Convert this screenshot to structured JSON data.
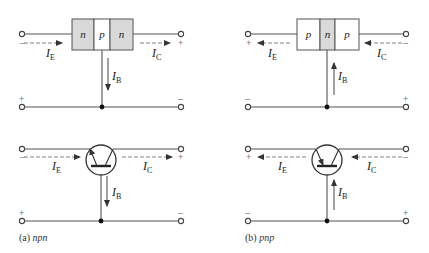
{
  "colors": {
    "line": "#555555",
    "shaded_region": "#d9d9d9",
    "unshaded_region": "#ffffff",
    "text": "#222222"
  },
  "npn": {
    "caption_prefix": "(a)",
    "caption_type": "npn",
    "layers": [
      "n",
      "p",
      "n"
    ],
    "shaded": [
      true,
      false,
      true
    ],
    "emitter_current": {
      "symbol": "I",
      "sub": "E",
      "direction": "right"
    },
    "collector_current": {
      "symbol": "I",
      "sub": "C",
      "direction": "right"
    },
    "base_current": {
      "symbol": "I",
      "sub": "B",
      "direction": "down"
    },
    "signs_top": {
      "left": "–",
      "right": "+"
    },
    "signs_bottom": {
      "left": "+",
      "right": "–"
    },
    "symbol": {
      "emitter_arrow": "outward"
    }
  },
  "pnp": {
    "caption_prefix": "(b)",
    "caption_type": "pnp",
    "layers": [
      "p",
      "n",
      "p"
    ],
    "shaded": [
      false,
      true,
      false
    ],
    "emitter_current": {
      "symbol": "I",
      "sub": "E",
      "direction": "left"
    },
    "collector_current": {
      "symbol": "I",
      "sub": "C",
      "direction": "left"
    },
    "base_current": {
      "symbol": "I",
      "sub": "B",
      "direction": "up"
    },
    "signs_top": {
      "left": "+",
      "right": "–"
    },
    "signs_bottom": {
      "left": "–",
      "right": "+"
    },
    "symbol": {
      "emitter_arrow": "inward"
    }
  }
}
